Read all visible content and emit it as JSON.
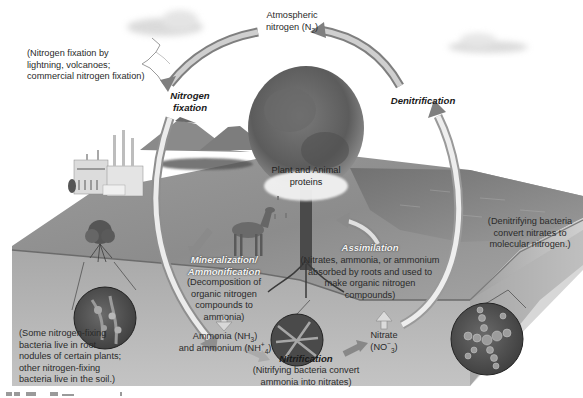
{
  "diagram": {
    "type": "nitrogen-cycle",
    "colors": {
      "background": "#ffffff",
      "soil_surface": "#a9a9a9",
      "soil_block": "#b4b4b4",
      "soil_front": "#c3c3c3",
      "arrow_fill": "#9a9a9a",
      "arrow_light": "#e6e6e6",
      "circle_inset": "#5a5a5a"
    },
    "labels": {
      "atmospheric_line1": "Atmospheric",
      "atmospheric_line2_prefix": "nitrogen (N",
      "atmospheric_sub": "2",
      "atmospheric_suffix": ")",
      "fixation_note": [
        "(Nitrogen fixation by",
        "lightning, volcanoes;",
        "commercial nitrogen fixation)"
      ],
      "nitrogen_fixation": [
        "Nitrogen",
        "fixation"
      ],
      "denitrification": "Denitrification",
      "plant_animal": [
        "Plant and Animal",
        "proteins"
      ],
      "mineralization": [
        "Mineralization/",
        "Ammonification"
      ],
      "mineralization_note": [
        "(Decomposition of",
        "organic nitrogen",
        "compounds to",
        "ammonia)"
      ],
      "assimilation": "Assimilation",
      "assimilation_note": [
        "(Nitrates, ammonia, or ammonium",
        "absorbed by roots and used to",
        "make organic nitrogen",
        "compounds)"
      ],
      "ammonia_prefix": "Ammonia (NH",
      "ammonia_sub": "3",
      "ammonia_suffix": ")",
      "ammonium_prefix": "and ammonium (NH",
      "ammonium_sup": "+",
      "ammonium_sub": "4",
      "ammonium_suffix": ")",
      "nitrification": "Nitrification",
      "nitrification_note": [
        "(Nitrifying bacteria convert",
        "ammonia into nitrates)"
      ],
      "nitrate": "Nitrate",
      "nitrate_formula_prefix": "(NO",
      "nitrate_sup": "−",
      "nitrate_sub": "3",
      "nitrate_suffix": ")",
      "denitrifying_note": [
        "(Denitrifying bacteria",
        "convert nitrates to",
        "molecular nitrogen.)"
      ],
      "root_nodule_note": [
        "(Some nitrogen-fixing",
        "bacteria live in root",
        "nodules of certain plants;",
        "other nitrogen-fixing",
        "bacteria live in the soil.)"
      ]
    },
    "icons": [
      "lightning-icon",
      "cloud-icon",
      "factory-icon",
      "volcano-icon",
      "tree-icon",
      "deer-icon",
      "shrub-icon",
      "bacteria-inset-icon",
      "cycle-arrow-icon"
    ]
  }
}
